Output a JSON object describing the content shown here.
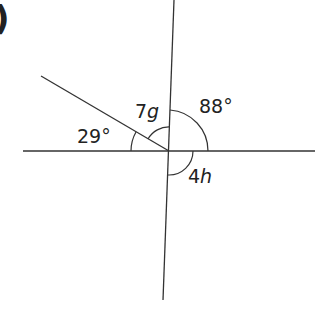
{
  "figure": {
    "part_marker": ")",
    "angles": [
      {
        "id": "a29",
        "label": "29°",
        "value_deg": 29,
        "is_variable": false
      },
      {
        "id": "a7g",
        "label_num": "7",
        "label_var": "g",
        "is_variable": true
      },
      {
        "id": "a88",
        "label": "88°",
        "value_deg": 88,
        "is_variable": false
      },
      {
        "id": "a4h",
        "label_num": "4",
        "label_var": "h",
        "is_variable": true
      }
    ],
    "line_color": "#333333",
    "text_color": "#222222"
  }
}
